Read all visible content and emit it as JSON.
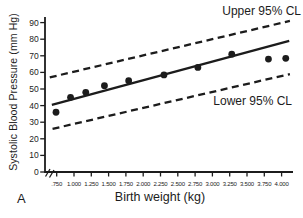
{
  "figure": {
    "panel_label": "A"
  },
  "chart_data": {
    "type": "scatter",
    "title": "",
    "xlabel": "Birth weight (kg)",
    "ylabel": "Systolic Blood Pressure (mm Hg)",
    "xlim": [
      0.6,
      4.2
    ],
    "ylim": [
      0,
      93
    ],
    "grid": false,
    "x_ticks": [
      ".750",
      "1.000",
      "1.250",
      "1.500",
      "1.750",
      "2.000",
      "2.250",
      "2.500",
      "2.750",
      "3.000",
      "3.250",
      "3.500",
      "3.750",
      "4.000"
    ],
    "x_tick_values": [
      0.75,
      1.0,
      1.25,
      1.5,
      1.75,
      2.0,
      2.25,
      2.5,
      2.75,
      3.0,
      3.25,
      3.5,
      3.75,
      4.0
    ],
    "y_ticks": [
      0,
      10,
      20,
      30,
      40,
      50,
      60,
      70,
      80,
      90
    ],
    "points": [
      [
        0.74,
        36
      ],
      [
        0.95,
        45
      ],
      [
        1.17,
        48
      ],
      [
        1.44,
        52
      ],
      [
        1.79,
        55
      ],
      [
        2.3,
        58.5
      ],
      [
        2.79,
        63
      ],
      [
        3.28,
        71
      ],
      [
        3.81,
        68
      ],
      [
        4.06,
        68.5
      ]
    ],
    "regression_line": {
      "x1": 0.68,
      "y1": 40.5,
      "x2": 4.11,
      "y2": 79
    },
    "upper_cl_line": {
      "x1": 0.65,
      "y1": 57,
      "x2": 4.12,
      "y2": 91
    },
    "lower_cl_line": {
      "x1": 0.69,
      "y1": 26,
      "x2": 4.12,
      "y2": 59
    },
    "annotations": {
      "upper": "Upper 95% CL",
      "lower": "Lower 95% CL"
    },
    "colors": {
      "ink": "#1c1c1c",
      "background": "#ffffff"
    }
  }
}
